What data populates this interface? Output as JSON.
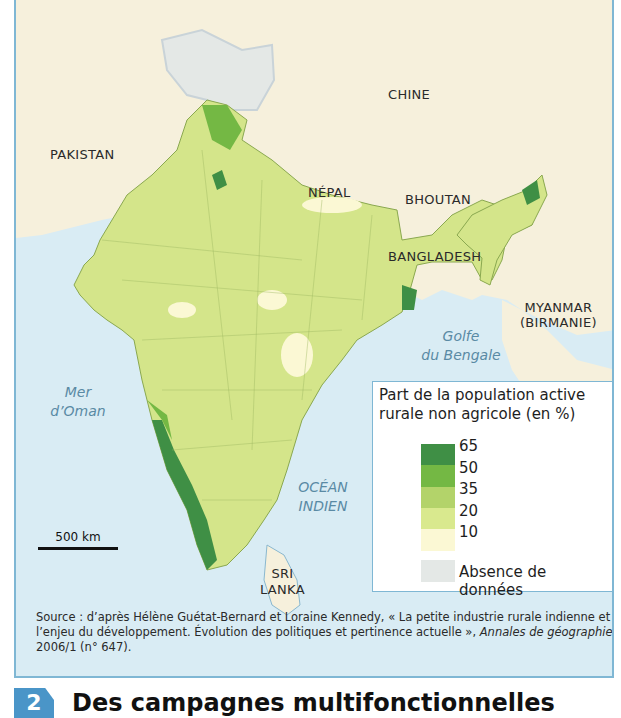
{
  "map": {
    "countries": [
      "PAKISTAN",
      "CHINE",
      "NÉPAL",
      "BHOUTAN",
      "BANGLADESH",
      "MYANMAR",
      "(BIRMANIE)",
      "SRI",
      "LANKA"
    ],
    "labels": {
      "pakistan": "PAKISTAN",
      "chine": "CHINE",
      "nepal": "NÉPAL",
      "bhoutan": "BHOUTAN",
      "bangladesh": "BANGLADESH",
      "myanmar_l1": "MYANMAR",
      "myanmar_l2": "(BIRMANIE)",
      "srilanka_l1": "SRI",
      "srilanka_l2": "LANKA"
    },
    "seas": {
      "mer_oman_l1": "Mer",
      "mer_oman_l2": "d’Oman",
      "golfe_l1": "Golfe",
      "golfe_l2": "du Bengale",
      "ocean_l1": "OCÉAN",
      "ocean_l2": "INDIEN"
    },
    "scale": "500 km",
    "colors": {
      "sea": "#d9ecf4",
      "land_other": "#f6f0dc",
      "no_data": "#e4e8e6",
      "border_line": "#b9c6cc"
    }
  },
  "legend": {
    "title": "Part de la population active rurale non agricole (en %)",
    "classes": [
      {
        "range": "50–65",
        "color": "#3f8f45"
      },
      {
        "range": "35–50",
        "color": "#74b844"
      },
      {
        "range": "20–35",
        "color": "#b3d36a"
      },
      {
        "range": "10–20",
        "color": "#d9e98e"
      },
      {
        "range": "0–10",
        "color": "#fbf8d4"
      }
    ],
    "ticks": [
      "65",
      "50",
      "35",
      "20",
      "10"
    ],
    "no_data_label": "Absence de données",
    "no_data_color": "#e4e8e6"
  },
  "source": {
    "prefix": "Source : d’après Hélène Guétat-Bernard et Loraine Kennedy, « La petite industrie rurale indienne et l’enjeu du développement. Évolution des politiques et pertinence actuelle », ",
    "journal": "Annales de géographie",
    "suffix": " 2006/1 (n° 647)."
  },
  "section": {
    "number": "2",
    "title": "Des campagnes multifonctionnelles"
  }
}
